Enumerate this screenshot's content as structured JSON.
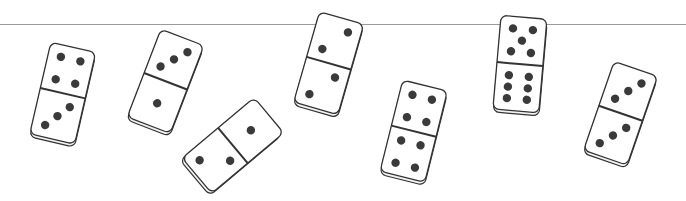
{
  "scene": {
    "line": {
      "y": 24,
      "color": "#9a9a9a"
    },
    "colors": {
      "face": "#ffffff",
      "edge": "#333333",
      "pip": "#3a3a3a",
      "side": "#f2f2f2"
    },
    "dominoes": [
      {
        "id": 1,
        "cx": 62,
        "cy": 92,
        "rotate": 13,
        "top": 4,
        "bottom": 3
      },
      {
        "id": 2,
        "cx": 165,
        "cy": 80,
        "rotate": 21,
        "top": 3,
        "bottom": 1
      },
      {
        "id": 3,
        "cx": 233,
        "cy": 144,
        "rotate": 50,
        "top": 1,
        "bottom": 2
      },
      {
        "id": 4,
        "cx": 328,
        "cy": 62,
        "rotate": 16,
        "top": 2,
        "bottom": 2
      },
      {
        "id": 5,
        "cx": 413,
        "cy": 130,
        "rotate": 14,
        "top": 4,
        "bottom": 4
      },
      {
        "id": 6,
        "cx": 519,
        "cy": 63,
        "rotate": 5,
        "top": 5,
        "bottom": 6
      },
      {
        "id": 7,
        "cx": 620,
        "cy": 112,
        "rotate": 19,
        "top": 3,
        "bottom": 3
      }
    ]
  }
}
